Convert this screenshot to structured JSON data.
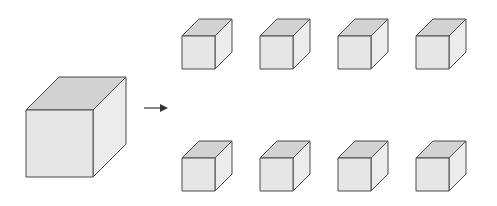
{
  "diagram": {
    "colors": {
      "stroke": "#4a4a4a",
      "front": "#e6e6e6",
      "top": "#d2d2d2",
      "side": "#ececec",
      "arrow": "#333333",
      "background": "#ffffff"
    },
    "large_cube": {
      "x": 26,
      "y": 110,
      "size": 67,
      "depth": 33
    },
    "arrow": {
      "x1": 144,
      "y1": 108,
      "x2": 170,
      "y2": 108
    },
    "small_cubes": [
      {
        "x": 182,
        "y": 36,
        "size": 33,
        "depth": 17
      },
      {
        "x": 260,
        "y": 36,
        "size": 33,
        "depth": 17
      },
      {
        "x": 338,
        "y": 36,
        "size": 33,
        "depth": 17
      },
      {
        "x": 416,
        "y": 36,
        "size": 33,
        "depth": 17
      },
      {
        "x": 182,
        "y": 158,
        "size": 33,
        "depth": 17
      },
      {
        "x": 260,
        "y": 158,
        "size": 33,
        "depth": 17
      },
      {
        "x": 338,
        "y": 158,
        "size": 33,
        "depth": 17
      },
      {
        "x": 416,
        "y": 158,
        "size": 33,
        "depth": 17
      }
    ],
    "small_cube_count": 8
  }
}
